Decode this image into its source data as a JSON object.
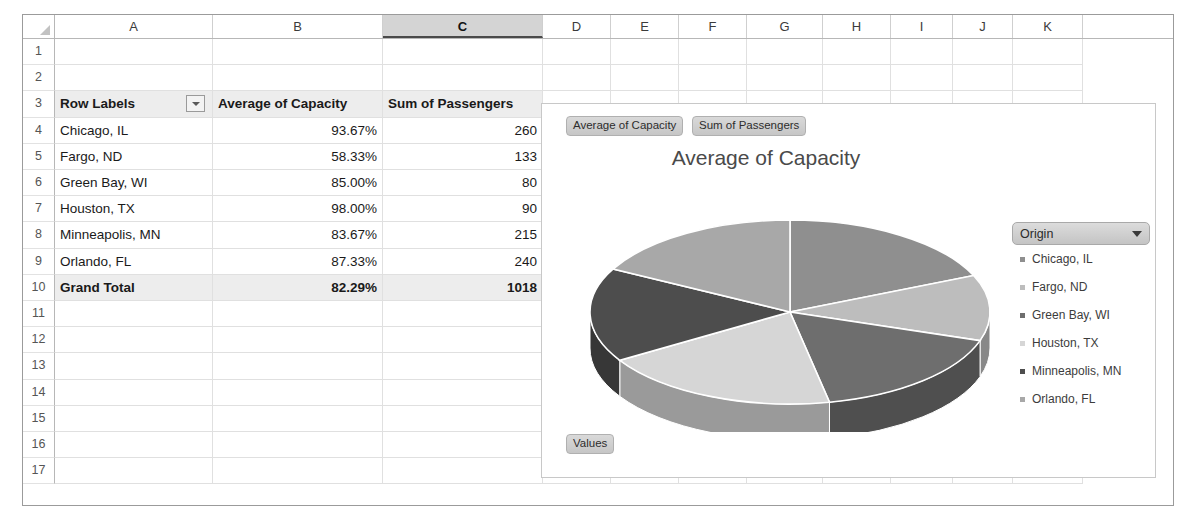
{
  "spreadsheet": {
    "columns": [
      "A",
      "B",
      "C",
      "D",
      "E",
      "F",
      "G",
      "H",
      "I",
      "J",
      "K"
    ],
    "selected_column": "C",
    "rows": [
      "1",
      "2",
      "3",
      "4",
      "5",
      "6",
      "7",
      "8",
      "9",
      "10",
      "11",
      "12",
      "13",
      "14",
      "15",
      "16",
      "17"
    ],
    "header_row": {
      "row_labels": "Row Labels",
      "col_b": "Average of Capacity",
      "col_c": "Sum of Passengers",
      "filter_icon": "chevron-down-icon"
    },
    "data_rows": [
      {
        "row": "4",
        "label": "Chicago, IL",
        "capacity": "93.67%",
        "passengers": "260"
      },
      {
        "row": "5",
        "label": "Fargo, ND",
        "capacity": "58.33%",
        "passengers": "133"
      },
      {
        "row": "6",
        "label": "Green Bay, WI",
        "capacity": "85.00%",
        "passengers": "80"
      },
      {
        "row": "7",
        "label": "Houston, TX",
        "capacity": "98.00%",
        "passengers": "90"
      },
      {
        "row": "8",
        "label": "Minneapolis, MN",
        "capacity": "83.67%",
        "passengers": "215"
      },
      {
        "row": "9",
        "label": "Orlando, FL",
        "capacity": "87.33%",
        "passengers": "240"
      }
    ],
    "total_row": {
      "row": "10",
      "label": "Grand Total",
      "capacity": "82.29%",
      "passengers": "1018"
    }
  },
  "chart": {
    "title": "Average of Capacity",
    "field_buttons": {
      "average_of_capacity": "Average of Capacity",
      "sum_of_passengers": "Sum of Passengers",
      "values": "Values"
    },
    "legend": {
      "header": "Origin",
      "dropdown_icon": "chevron-down-icon",
      "items": [
        {
          "label": "Chicago, IL",
          "color": "#8f8f8f"
        },
        {
          "label": "Fargo, ND",
          "color": "#bdbdbd"
        },
        {
          "label": "Green Bay, WI",
          "color": "#6e6e6e"
        },
        {
          "label": "Houston, TX",
          "color": "#d6d6d6"
        },
        {
          "label": "Minneapolis, MN",
          "color": "#4d4d4d"
        },
        {
          "label": "Orlando, FL",
          "color": "#a8a8a8"
        }
      ]
    }
  },
  "chart_data": {
    "type": "pie",
    "title": "Average of Capacity",
    "three_d": true,
    "categories": [
      "Chicago, IL",
      "Fargo, ND",
      "Green Bay, WI",
      "Houston, TX",
      "Minneapolis, MN",
      "Orlando, FL"
    ],
    "values": [
      93.67,
      58.33,
      85.0,
      98.0,
      83.67,
      87.33
    ],
    "value_unit": "percent",
    "value_labels": [
      "93.67%",
      "58.33%",
      "85.00%",
      "98.00%",
      "83.67%",
      "87.33%"
    ],
    "colors": [
      "#8f8f8f",
      "#bdbdbd",
      "#6e6e6e",
      "#d6d6d6",
      "#4d4d4d",
      "#a8a8a8"
    ],
    "legend_position": "right",
    "legend_title": "Origin",
    "data_labels_shown": false,
    "series_name": "Average of Capacity"
  }
}
